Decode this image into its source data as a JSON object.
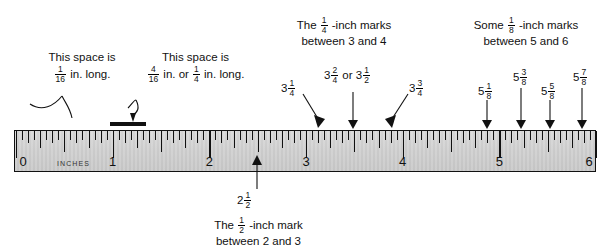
{
  "diagram": {
    "ruler": {
      "unit_word": "INCHES",
      "major_labels": [
        "0",
        "1",
        "2",
        "3",
        "4",
        "5",
        "6"
      ],
      "min_inch": 0,
      "max_inch": 6,
      "smallest_division": "1/16 inch"
    },
    "annotations": {
      "space_1_16": {
        "line1": "This space is",
        "whole": "",
        "fraction_num": "1",
        "fraction_den": "16",
        "tail": "in. long."
      },
      "space_4_16": {
        "line1": "This space is",
        "fraction_num": "4",
        "fraction_den": "16",
        "mid": "in. or",
        "fraction2_num": "1",
        "fraction2_den": "4",
        "tail": "in. long."
      },
      "quarter_marks": {
        "lead": "The",
        "fraction_num": "1",
        "fraction_den": "4",
        "mid": "-inch marks",
        "line2": "between 3 and 4"
      },
      "eighth_marks": {
        "lead": "Some",
        "fraction_num": "1",
        "fraction_den": "8",
        "mid": "-inch marks",
        "line2": "between 5 and 6"
      },
      "half_mark": {
        "lead": "The",
        "fraction_num": "1",
        "fraction_den": "2",
        "mid": "-inch mark",
        "line2": "between 2 and 3"
      }
    },
    "value_labels": {
      "three_quarter_low": {
        "whole": "3",
        "num": "1",
        "den": "4"
      },
      "three_half_a": {
        "whole": "3",
        "num": "2",
        "den": "4"
      },
      "three_half_or": "or",
      "three_half_b": {
        "whole": "3",
        "num": "1",
        "den": "2"
      },
      "three_three_four": {
        "whole": "3",
        "num": "3",
        "den": "4"
      },
      "five_one_eight": {
        "whole": "5",
        "num": "1",
        "den": "8"
      },
      "five_three_eight": {
        "whole": "5",
        "num": "3",
        "den": "8"
      },
      "five_five_eight": {
        "whole": "5",
        "num": "5",
        "den": "8"
      },
      "five_seven_eight": {
        "whole": "5",
        "num": "7",
        "den": "8"
      },
      "two_and_half": {
        "whole": "2",
        "num": "1",
        "den": "2"
      }
    },
    "colors": {
      "ink": "#111111",
      "ruler_face": "#d0d0d0",
      "page": "#ffffff"
    }
  }
}
